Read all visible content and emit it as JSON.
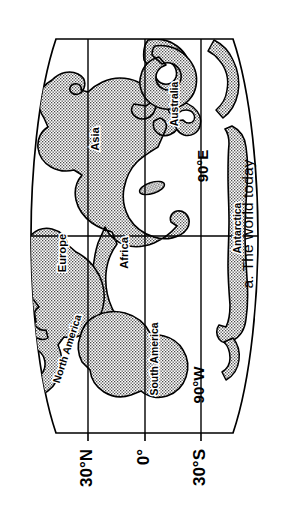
{
  "figure": {
    "caption": "a. The world today",
    "type": "world-map-diagram"
  },
  "map": {
    "projection_outline": "lens-shaped (oval / sinusoidal-like) world outline",
    "orientation_note": "whole figure rotated 90 degrees clockwise",
    "land_fill_pattern": "stipple-dots",
    "line_color": "#000000",
    "background_color": "#ffffff"
  },
  "axis": {
    "name": "latitude-axis",
    "ticks": [
      {
        "label": "30°N",
        "value": 30
      },
      {
        "label": "0°",
        "value": 0
      },
      {
        "label": "30°S",
        "value": -30
      }
    ]
  },
  "meridians": [
    {
      "label": "90°W",
      "value": -90
    },
    {
      "label": "90°E",
      "value": 90
    }
  ],
  "continents": [
    {
      "name": "North America",
      "label": "North America"
    },
    {
      "name": "South America",
      "label": "South America"
    },
    {
      "name": "Europe",
      "label": "Europe"
    },
    {
      "name": "Africa",
      "label": "Africa"
    },
    {
      "name": "Asia",
      "label": "Asia"
    },
    {
      "name": "Australia",
      "label": "Australia"
    },
    {
      "name": "Antarctica",
      "label": "Antarctica"
    }
  ]
}
